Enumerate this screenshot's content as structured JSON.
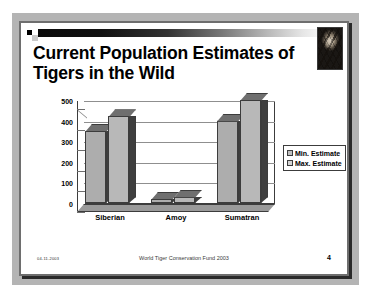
{
  "slide": {
    "title": "Current Population Estimates of Tigers in the Wild",
    "title_line1": "Current Population Estimates of",
    "title_line2": "Tigers in the Wild"
  },
  "decor": {
    "tiger_photo_alt": "tiger-photograph",
    "accent_bar": "gradient-bar"
  },
  "footer": {
    "date": "04-11-2003",
    "center": "World Tiger Conservation Fund 2003",
    "page": "4"
  },
  "chart_data": {
    "type": "bar",
    "title": "Current Population Estimates of Tigers in the Wild",
    "xlabel": "",
    "ylabel": "",
    "ylim": [
      0,
      500
    ],
    "yticks": [
      0,
      100,
      200,
      300,
      400,
      500
    ],
    "ytick_labels": [
      "0",
      "100",
      "200",
      "300",
      "400",
      "500"
    ],
    "grid": true,
    "legend_position": "right",
    "three_d": true,
    "categories": [
      "Siberian",
      "Amoy",
      "Sumatran"
    ],
    "series": [
      {
        "name": "Min. Estimate",
        "values": [
          350,
          20,
          400
        ]
      },
      {
        "name": "Max. Estimate",
        "values": [
          420,
          30,
          500
        ]
      }
    ]
  }
}
